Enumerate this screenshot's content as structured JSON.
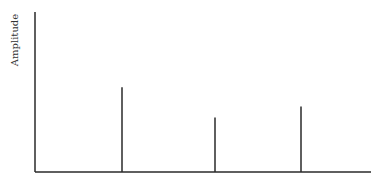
{
  "chart_data": {
    "type": "bar",
    "style": "stem",
    "title": "",
    "xlabel": "",
    "ylabel": "Amplitude",
    "grid": false,
    "legend": null,
    "x": [
      1,
      2,
      3
    ],
    "values": [
      0.53,
      0.34,
      0.41
    ],
    "xlim": [
      0,
      3.7
    ],
    "ylim": [
      0,
      1
    ],
    "colors": {
      "line": "#2a2a2a",
      "label": "#333333"
    }
  }
}
